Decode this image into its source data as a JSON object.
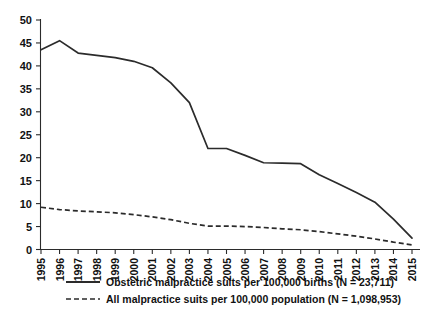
{
  "chart_data": {
    "type": "line",
    "title": "",
    "subtitle": "",
    "xlabel": "",
    "ylabel": "",
    "grid": false,
    "legend_position": "bottom",
    "xlim": [
      1995,
      2015
    ],
    "ylim": [
      0,
      50
    ],
    "yticks": [
      0,
      5,
      10,
      15,
      20,
      25,
      30,
      35,
      40,
      45,
      50
    ],
    "ytick_labels": [
      "0",
      "5",
      "10",
      "15",
      "20",
      "25",
      "30",
      "35",
      "40",
      "45",
      "50"
    ],
    "categories": [
      1995,
      1996,
      1997,
      1998,
      1999,
      2000,
      2001,
      2002,
      2003,
      2004,
      2005,
      2006,
      2007,
      2008,
      2009,
      2010,
      2011,
      2012,
      2013,
      2014,
      2015
    ],
    "xtick_labels": [
      "1995",
      "1996",
      "1997",
      "1998",
      "1999",
      "2000",
      "2001",
      "2002",
      "2003",
      "2004",
      "2005",
      "2006",
      "2007",
      "2008",
      "2009",
      "2010",
      "2011",
      "2012",
      "2013",
      "2014",
      "2015"
    ],
    "series": [
      {
        "name": "Obstetric malpractice suits per 100,000 births (N = 23,711)",
        "style": "solid",
        "color": "#2b2b2b",
        "values": [
          43.5,
          45.5,
          42.8,
          42.3,
          41.8,
          41.0,
          39.6,
          36.3,
          32.0,
          22.0,
          22.0,
          20.5,
          18.9,
          18.8,
          18.7,
          16.3,
          14.4,
          12.4,
          10.3,
          6.6,
          2.5
        ]
      },
      {
        "name": "All malpractice suits per 100,000 population (N = 1,098,953)",
        "style": "dashed",
        "color": "#2b2b2b",
        "values": [
          9.2,
          8.7,
          8.4,
          8.2,
          8.0,
          7.6,
          7.1,
          6.5,
          5.7,
          5.1,
          5.1,
          5.0,
          4.8,
          4.5,
          4.3,
          3.9,
          3.4,
          2.9,
          2.3,
          1.6,
          1.0
        ]
      }
    ],
    "legend": [
      {
        "label": "Obstetric malpractice suits per 100,000 births (N = 23,711)",
        "style": "solid"
      },
      {
        "label": "All malpractice suits per 100,000 population (N = 1,098,953)",
        "style": "dashed"
      }
    ]
  }
}
